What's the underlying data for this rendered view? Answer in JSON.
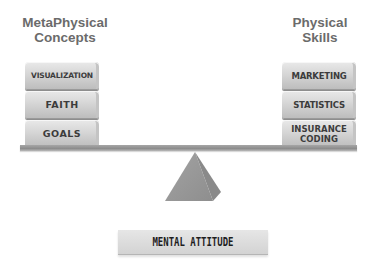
{
  "diagram": {
    "left": {
      "title_lines": [
        "MetaPhysical",
        "Concepts"
      ],
      "blocks": [
        {
          "label": "VISUALIZATION"
        },
        {
          "label": "FAITH"
        },
        {
          "label": "GOALS"
        }
      ]
    },
    "right": {
      "title_lines": [
        "Physical",
        "Skills"
      ],
      "blocks": [
        {
          "label": "MARKETING"
        },
        {
          "label": "STATISTICS"
        },
        {
          "label_lines": [
            "INSURANCE",
            "CODING"
          ]
        }
      ]
    },
    "fulcrum_label": "MENTAL ATTITUDE",
    "colors": {
      "title": "#6b6b6b",
      "block_text": "#3c3c3c",
      "beam": "#999999",
      "fulcrum": "#9a9a9a",
      "label_bg": "#dcdcdc"
    }
  }
}
